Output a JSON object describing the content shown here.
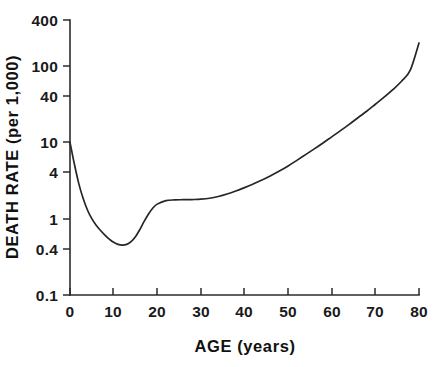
{
  "chart_data": {
    "type": "line",
    "title": "",
    "xlabel": "AGE  (years)",
    "ylabel": "DEATH RATE  (per 1,000)",
    "yscale": "log",
    "xscale": "linear",
    "xlim": [
      0,
      80
    ],
    "ylim": [
      0.1,
      400
    ],
    "grid": false,
    "legend": null,
    "xticks": [
      0,
      10,
      20,
      30,
      40,
      50,
      60,
      70,
      80
    ],
    "xticklabels": [
      "0",
      "10",
      "20",
      "30",
      "40",
      "50",
      "60",
      "70",
      "80"
    ],
    "yticks": [
      0.1,
      0.4,
      1,
      4,
      10,
      40,
      100,
      400
    ],
    "yticklabels": [
      "0.1",
      "0.4",
      "1",
      "4",
      "10",
      "40",
      "100",
      "400"
    ],
    "series": [
      {
        "name": "death rate",
        "x": [
          0,
          1,
          2,
          3,
          4,
          5,
          6,
          7,
          8,
          9,
          10,
          11,
          12,
          13,
          14,
          15,
          16,
          17,
          18,
          19,
          20,
          22,
          24,
          26,
          28,
          30,
          32,
          34,
          36,
          38,
          40,
          42,
          44,
          46,
          48,
          50,
          52,
          54,
          56,
          58,
          60,
          62,
          64,
          66,
          68,
          70,
          72,
          74,
          76,
          78,
          80
        ],
        "values": [
          10.0,
          5.2,
          2.9,
          1.85,
          1.3,
          1.0,
          0.82,
          0.7,
          0.61,
          0.54,
          0.49,
          0.46,
          0.45,
          0.46,
          0.5,
          0.58,
          0.72,
          0.92,
          1.15,
          1.38,
          1.55,
          1.72,
          1.76,
          1.77,
          1.78,
          1.8,
          1.85,
          1.95,
          2.1,
          2.3,
          2.55,
          2.85,
          3.2,
          3.65,
          4.2,
          4.9,
          5.8,
          6.9,
          8.2,
          9.8,
          11.8,
          14.2,
          17.2,
          21.0,
          25.5,
          31.5,
          39.0,
          49.0,
          63.0,
          88.0,
          200.0
        ]
      }
    ]
  },
  "figure": {
    "plot_left_px": 70,
    "plot_right_px": 419,
    "plot_top_px": 20,
    "plot_bottom_px": 295
  }
}
